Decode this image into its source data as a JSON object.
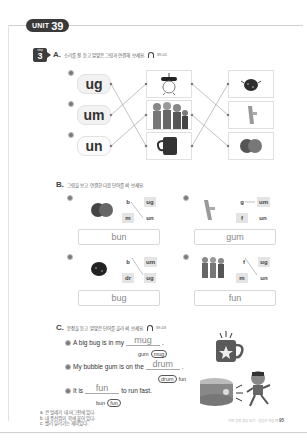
{
  "header": {
    "unit_word": "UNIT",
    "unit_number": "39"
  },
  "step": {
    "word": "step",
    "number": "3"
  },
  "section_a": {
    "letter": "A.",
    "instruction": "소리를 잘 듣고 알맞은 그림과 연결해 보세요.",
    "track": "39-01",
    "numbers": [
      "a",
      "b",
      "c"
    ],
    "syllables": [
      "ug",
      "um",
      "un"
    ],
    "middle_pictures": [
      "drum-image",
      "kids-having-fun-image",
      "mug-image"
    ],
    "right_pictures": [
      "ladybug-image",
      "gum-image",
      "bun-image"
    ]
  },
  "section_b": {
    "letter": "B.",
    "instruction": "그림을 보고 연결한 다음 단어를 써 보세요.",
    "items": [
      {
        "num": "a",
        "picture": "bun-image",
        "onsets": [
          "b",
          "m"
        ],
        "rimes": [
          "ug",
          "un"
        ],
        "answer": "bun"
      },
      {
        "num": "b",
        "picture": "gum-image",
        "onsets": [
          "g",
          "f"
        ],
        "rimes": [
          "um",
          "un"
        ],
        "answer": "gum"
      },
      {
        "num": "c",
        "picture": "ladybug-image",
        "onsets": [
          "b",
          "dr"
        ],
        "rimes": [
          "um",
          "ug"
        ],
        "answer": "bug"
      },
      {
        "num": "d",
        "picture": "kids-image",
        "onsets": [
          "f",
          "m"
        ],
        "rimes": [
          "ug",
          "un"
        ],
        "answer": "fun"
      }
    ]
  },
  "section_c": {
    "letter": "C.",
    "instruction": "문장을 듣고 알맞은 단어를 골라 써 보세요.",
    "track": "39-03",
    "sentences": [
      {
        "num": "a",
        "before": "A big bug is in my",
        "answer": "mug",
        "after": ".",
        "choices": [
          "gum",
          "mug"
        ],
        "selected": "mug"
      },
      {
        "num": "b",
        "before": "My bubble gum is on the",
        "answer": "drum",
        "after": ".",
        "choices": [
          "drum",
          "fun"
        ],
        "selected": "drum"
      },
      {
        "num": "c",
        "before": "It is",
        "answer": "fun",
        "after": "to run fast.",
        "choices": [
          "bun",
          "fun"
        ],
        "selected": "fun"
      }
    ],
    "translations": [
      "a. 큰 벌레가 내 머그잔에 있다.",
      "b. 내 풍선껌이 북에 붙어 있다.",
      "c. 빨리 달리기는 재미있다."
    ]
  },
  "footer": {
    "text": "이번 장의 정답 보기 · 정답과 해설 쪽",
    "page": "95"
  }
}
